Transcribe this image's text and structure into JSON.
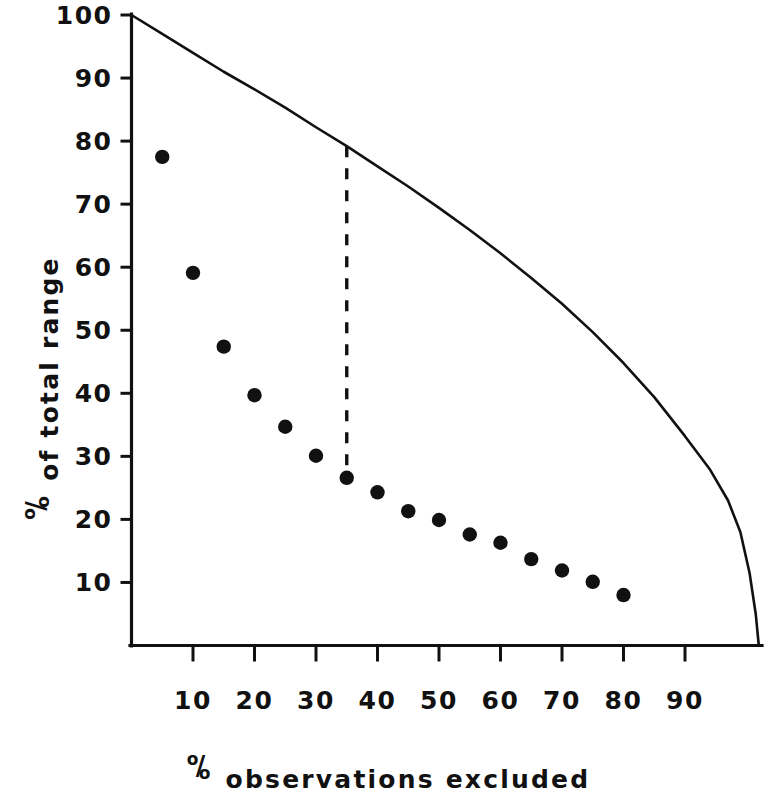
{
  "chart_data": {
    "type": "scatter",
    "title": "",
    "xlabel": "% observations excluded",
    "ylabel": "% of total range",
    "xlabel_prefix_glyph": "percent-oslasho",
    "ylabel_prefix_glyph": "percent-oslasho",
    "xlabel_text_after_glyph": "observations excluded",
    "ylabel_text_after_glyph": "of total range",
    "xlim": [
      0,
      103
    ],
    "ylim": [
      0,
      100
    ],
    "grid": false,
    "legend": "none",
    "x_ticks": [
      10,
      20,
      30,
      40,
      50,
      60,
      70,
      80,
      90
    ],
    "y_ticks": [
      10,
      20,
      30,
      40,
      50,
      60,
      70,
      80,
      90,
      100
    ],
    "x_tick_labels": [
      "10",
      "20",
      "30",
      "40",
      "50",
      "60",
      "70",
      "80",
      "90"
    ],
    "y_tick_labels": [
      "10",
      "20",
      "30",
      "40",
      "50",
      "60",
      "70",
      "80",
      "90",
      "100"
    ],
    "series": [
      {
        "name": "observed % of total range",
        "type": "scatter",
        "marker": "filled-circle",
        "color": "#111111",
        "x": [
          5,
          10,
          15,
          20,
          25,
          30,
          35,
          40,
          45,
          50,
          55,
          60,
          65,
          70,
          75,
          80
        ],
        "y": [
          77.5,
          59.1,
          47.4,
          39.7,
          34.7,
          30.1,
          26.6,
          24.3,
          21.3,
          19.9,
          17.6,
          16.3,
          13.7,
          11.9,
          10.1,
          8.0
        ]
      },
      {
        "name": "theoretical boundary curve",
        "type": "line",
        "color": "#111111",
        "x": [
          0,
          5,
          10,
          15,
          20,
          25,
          30,
          35,
          40,
          45,
          50,
          55,
          60,
          65,
          70,
          75,
          80,
          85,
          90,
          94,
          97,
          99,
          100.5,
          101.5,
          102
        ],
        "y": [
          100,
          97,
          94,
          91,
          88.2,
          85.3,
          82.2,
          79.2,
          76.0,
          72.8,
          69.4,
          65.9,
          62.2,
          58.3,
          54.2,
          49.7,
          44.8,
          39.4,
          33.2,
          28.0,
          23.0,
          18.0,
          11.5,
          5.0,
          0
        ]
      }
    ],
    "annotations": [
      {
        "name": "reference-dashed-line",
        "type": "vertical-dashed-line",
        "x": 35,
        "y_from": 26.6,
        "y_to": 79.2,
        "color": "#111111"
      }
    ]
  },
  "axes": {
    "y_axis_name": "y-axis",
    "x_axis_name": "x-axis"
  }
}
